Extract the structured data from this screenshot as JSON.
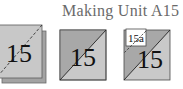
{
  "title": "Making Unit A15",
  "colors": {
    "dark_gray": "#a9a9a9",
    "light_gray": "#c9c9c9",
    "back_square": "#9e9e9e",
    "outline": "#4a4a4a",
    "label_bg": "#ffffff",
    "title_text": "#6a6a6a"
  },
  "steps": [
    {
      "label": "15",
      "kind": "stacked-squares-dashed-diagonal"
    },
    {
      "label": "15",
      "kind": "half-square-triangle"
    },
    {
      "label": "15",
      "sublabel": "15a",
      "kind": "half-square-triangle-with-patch"
    }
  ]
}
